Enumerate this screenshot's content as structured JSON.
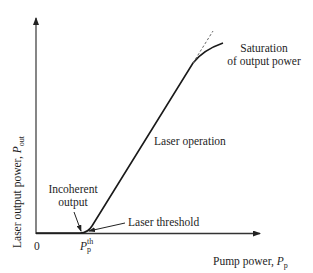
{
  "figure": {
    "x_axis": {
      "label": "Pump power, ",
      "symbol": "P",
      "subscript": "p",
      "origin_label": "0",
      "threshold_tick": {
        "symbol": "P",
        "subscript": "p",
        "superscript": "th"
      }
    },
    "y_axis": {
      "label": "Laser output power, ",
      "symbol": "P",
      "subscript": "out"
    },
    "annotations": {
      "incoherent_line1": "Incoherent",
      "incoherent_line2": "output",
      "laser_threshold": "Laser threshold",
      "laser_operation": "Laser operation",
      "saturation_line1": "Saturation",
      "saturation_line2": "of output power"
    },
    "colors": {
      "curve": "#1a1a1a",
      "axis": "#333333",
      "dashed": "#666666",
      "text": "#1e1e1e"
    }
  }
}
